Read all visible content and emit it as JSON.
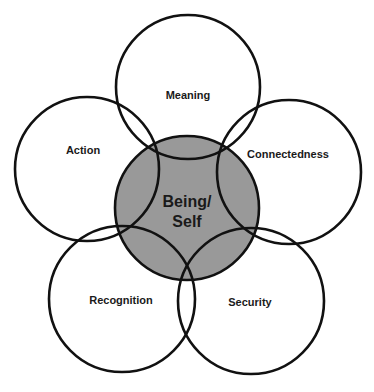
{
  "diagram": {
    "type": "overlapping-circles",
    "colors": {
      "stroke": "#111111",
      "outer_fill": "none",
      "center_fill": "#999999",
      "background": "#ffffff"
    },
    "center": {
      "label_line1": "Being/",
      "label_line2": "Self"
    },
    "outer": [
      {
        "label": "Meaning"
      },
      {
        "label": "Action"
      },
      {
        "label": "Connectedness"
      },
      {
        "label": "Recognition"
      },
      {
        "label": "Security"
      }
    ]
  }
}
